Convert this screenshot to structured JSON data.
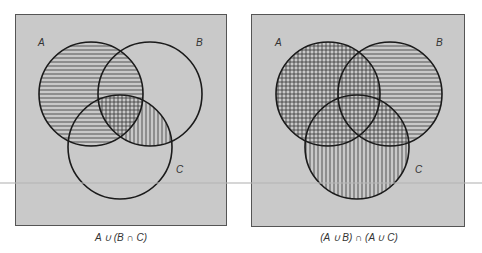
{
  "colors": {
    "panel_fill": "#c9c9c9",
    "panel_border": "#555555",
    "circle_stroke": "#1a1a1a",
    "hatch": "#333333",
    "scan_line": "#b4b4b4"
  },
  "panels": [
    {
      "caption": "A ∪ (B ∩ C)",
      "labels": {
        "A": "A",
        "B": "B",
        "C": "C"
      },
      "shading": {
        "horizontal": "A",
        "vertical": "B ∩ C"
      }
    },
    {
      "caption": "(A ∪ B) ∩ (A ∪ C)",
      "labels": {
        "A": "A",
        "B": "B",
        "C": "C"
      },
      "shading": {
        "horizontal": "A ∪ B",
        "vertical": "A ∪ C"
      }
    }
  ]
}
